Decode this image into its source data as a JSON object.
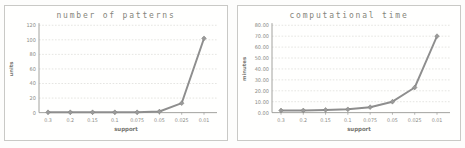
{
  "figure": {
    "background": "#fdfdfc",
    "panel_border_color": "#c9c9c6",
    "title_color": "#85857b"
  },
  "chart_data": [
    {
      "type": "line",
      "title": "number of patterns",
      "xlabel": "support",
      "ylabel": "units",
      "categories": [
        "0.3",
        "0.2",
        "0.15",
        "0.1",
        "0.075",
        "0.05",
        "0.025",
        "0.01"
      ],
      "values": [
        0.5,
        0.5,
        0.5,
        0.5,
        0.5,
        1.5,
        13,
        102
      ],
      "ylim": [
        0,
        120
      ],
      "yticks": [
        0,
        20,
        40,
        60,
        80,
        100,
        120
      ],
      "ytick_labels": [
        "0",
        "20",
        "40",
        "60",
        "80",
        "100",
        "120"
      ],
      "grid": "horizontal-dotted",
      "legend": "none",
      "line_color": "#8e8e8e",
      "marker": "diamond",
      "marker_color": "#9a9a9a",
      "grid_color": "#dadad7",
      "axis_color": "#9a9a97",
      "tick_text_color": "#8b8b86"
    },
    {
      "type": "line",
      "title": "computational time",
      "xlabel": "support",
      "ylabel": "minutes",
      "categories": [
        "0.3",
        "0.2",
        "0.15",
        "0.1",
        "0.075",
        "0.05",
        "0.025",
        "0.01"
      ],
      "values": [
        2,
        2,
        2.5,
        3,
        5,
        10,
        23,
        70
      ],
      "ylim": [
        0,
        80
      ],
      "yticks": [
        0,
        10,
        20,
        30,
        40,
        50,
        60,
        70,
        80
      ],
      "ytick_labels": [
        "0.00",
        "10.00",
        "20.00",
        "30.00",
        "40.00",
        "50.00",
        "60.00",
        "70.00",
        "80.00"
      ],
      "grid": "horizontal-dotted",
      "legend": "none",
      "line_color": "#8e8e8e",
      "marker": "diamond",
      "marker_color": "#9a9a9a",
      "grid_color": "#dadad7",
      "axis_color": "#9a9a97",
      "tick_text_color": "#8b8b86"
    }
  ]
}
